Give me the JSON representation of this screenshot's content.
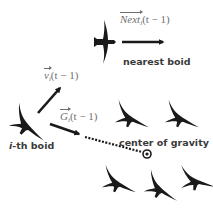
{
  "diagram": {
    "labels": {
      "nearest_boid": "nearest boid",
      "ith_boid_prefix": "i",
      "ith_boid_suffix": "-th boid",
      "center_of_gravity": "center of gravity"
    },
    "vectors": {
      "next": {
        "symbol": "Next",
        "subscript": "i",
        "argument": "(t − 1)"
      },
      "velocity": {
        "symbol": "v",
        "subscript": "i",
        "argument": "(t − 1)"
      },
      "gravity": {
        "symbol": "G",
        "subscript": "i",
        "argument": "(t − 1)"
      }
    },
    "colors": {
      "bird": "#1a1a1a",
      "arrow": "#1a1a1a",
      "math_text": "#6f6f6f",
      "label_text": "#3a3a3a",
      "background": "#ffffff"
    },
    "boids": [
      {
        "role": "nearest-boid",
        "x": 107,
        "y": 42,
        "heading": "right"
      },
      {
        "role": "i-th-boid",
        "x": 25,
        "y": 124,
        "heading": "lower-left"
      },
      {
        "role": "flock",
        "x": 130,
        "y": 115
      },
      {
        "role": "flock",
        "x": 180,
        "y": 115
      },
      {
        "role": "flock",
        "x": 117,
        "y": 178
      },
      {
        "role": "flock",
        "x": 160,
        "y": 185
      },
      {
        "role": "flock",
        "x": 195,
        "y": 175
      }
    ]
  }
}
